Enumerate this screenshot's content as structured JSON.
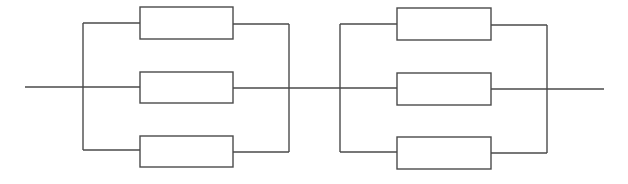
{
  "diagram": {
    "type": "circuit",
    "stroke_color": "#4a4a4a",
    "background": "#ffffff",
    "groups": [
      {
        "name": "group-1",
        "resistor_count": 3,
        "left_bus_x": 83,
        "right_bus_x": 289,
        "resistor_x": 140,
        "resistor_w": 93,
        "branches": [
          {
            "wire_y_left": 23,
            "wire_y_right": 24,
            "box_y": 7,
            "box_h": 32
          },
          {
            "wire_y_left": 87,
            "wire_y_right": 88,
            "box_y": 72,
            "box_h": 31
          },
          {
            "wire_y_left": 150,
            "wire_y_right": 152,
            "box_y": 136,
            "box_h": 31
          }
        ]
      },
      {
        "name": "group-2",
        "resistor_count": 3,
        "left_bus_x": 340,
        "right_bus_x": 547,
        "resistor_x": 397,
        "resistor_w": 94,
        "branches": [
          {
            "wire_y_left": 24,
            "wire_y_right": 25,
            "box_y": 8,
            "box_h": 32
          },
          {
            "wire_y_left": 88,
            "wire_y_right": 89,
            "box_y": 73,
            "box_h": 32
          },
          {
            "wire_y_left": 152,
            "wire_y_right": 153,
            "box_y": 137,
            "box_h": 32
          }
        ]
      }
    ],
    "main_wire": {
      "x_start": 25,
      "x_end": 604,
      "y": 87
    }
  }
}
